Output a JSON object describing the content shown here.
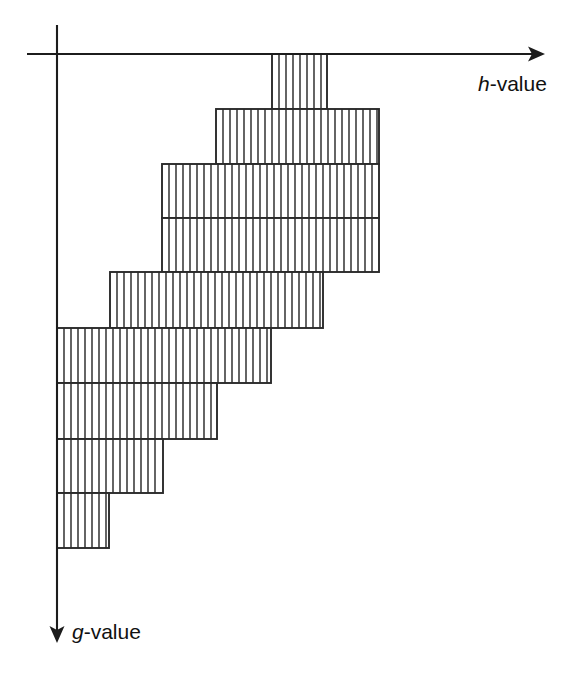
{
  "figure": {
    "title": "",
    "background_color": "#ffffff",
    "line_color": "#2a2a2a",
    "axis_color": "#1c1c1c",
    "fill_color": "#ffffff"
  },
  "axes": {
    "horizontal": {
      "name": "h-axis",
      "label_variable": "h",
      "label_suffix": "-value",
      "label_full": "h-value",
      "direction": "right",
      "x_start": 27,
      "x_end": 545,
      "y": 54,
      "label_x": 478,
      "label_y": 91
    },
    "vertical": {
      "name": "g-axis",
      "label_variable": "g",
      "label_suffix": "-value",
      "label_full": "g-value",
      "direction": "down",
      "x": 57,
      "y_start": 25,
      "y_end": 643,
      "label_x": 72,
      "label_y": 639
    }
  },
  "chart_data": {
    "type": "bar",
    "title": "",
    "xlabel": "h-value",
    "ylabel": "g-value",
    "orientation": "horizontal-staircase",
    "grid": false,
    "legend": false,
    "hatch": "vertical-lines",
    "hatch_spacing_px": 7,
    "bands": [
      {
        "index": 1,
        "x0": 272,
        "x1": 327,
        "y0": 54,
        "y1": 109
      },
      {
        "index": 2,
        "x0": 216,
        "x1": 379,
        "y0": 109,
        "y1": 164
      },
      {
        "index": 3,
        "x0": 162,
        "x1": 379,
        "y0": 164,
        "y1": 218
      },
      {
        "index": 4,
        "x0": 162,
        "x1": 379,
        "y0": 218,
        "y1": 272
      },
      {
        "index": 5,
        "x0": 110,
        "x1": 323,
        "y0": 272,
        "y1": 328
      },
      {
        "index": 6,
        "x0": 57,
        "x1": 271,
        "y0": 328,
        "y1": 383
      },
      {
        "index": 7,
        "x0": 57,
        "x1": 217,
        "y0": 383,
        "y1": 439
      },
      {
        "index": 8,
        "x0": 57,
        "x1": 163,
        "y0": 439,
        "y1": 493
      },
      {
        "index": 9,
        "x0": 57,
        "x1": 109,
        "y0": 493,
        "y1": 548
      }
    ]
  }
}
